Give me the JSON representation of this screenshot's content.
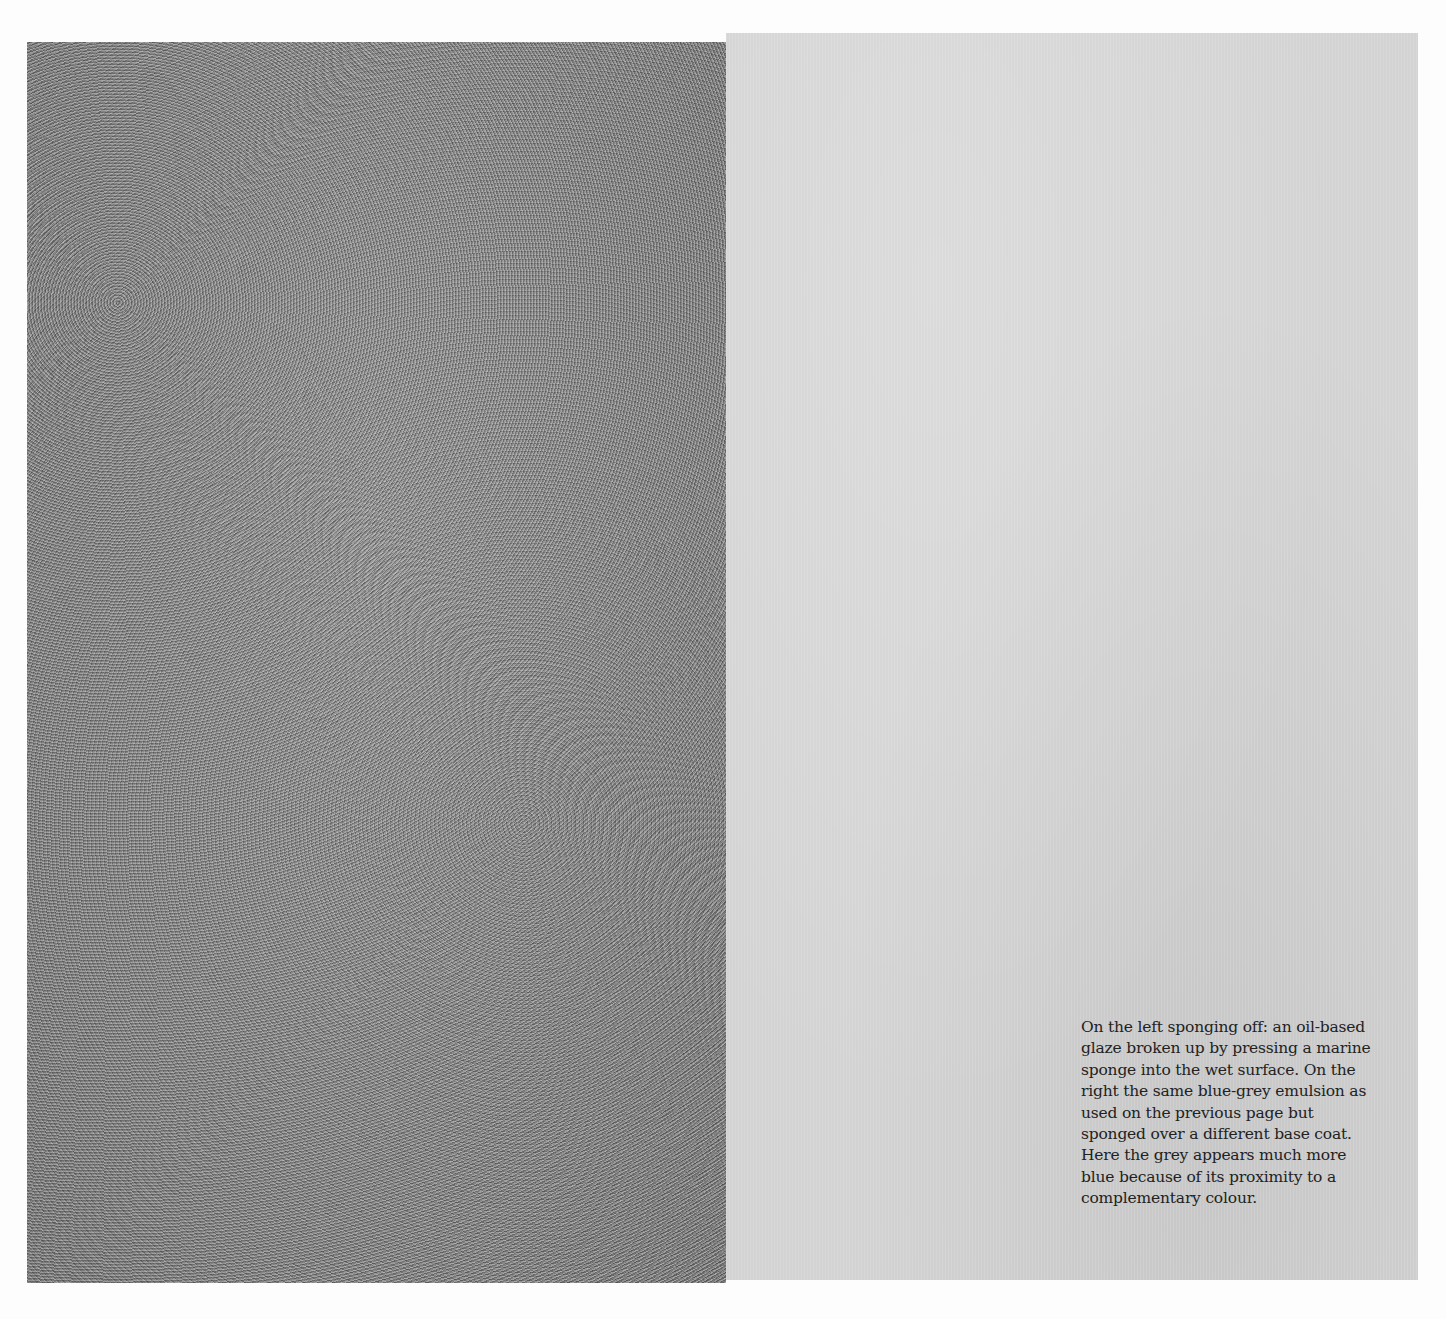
{
  "page": {
    "left_swatch": {
      "label": "sponging off",
      "color": "#8a8a8a"
    },
    "right_swatch": {
      "label": "blue-grey emulsion sponged",
      "color": "#d3d3d3"
    },
    "caption": {
      "lines": [
        "On the left sponging off: an oil-based",
        "glaze broken up by pressing a marine",
        "sponge into the wet surface. On the",
        "right the same blue-grey emulsion as",
        "used on the previous page but",
        "sponged over a different base coat.",
        "Here the grey appears much more",
        "blue because of its proximity to a",
        "complementary colour."
      ]
    }
  }
}
